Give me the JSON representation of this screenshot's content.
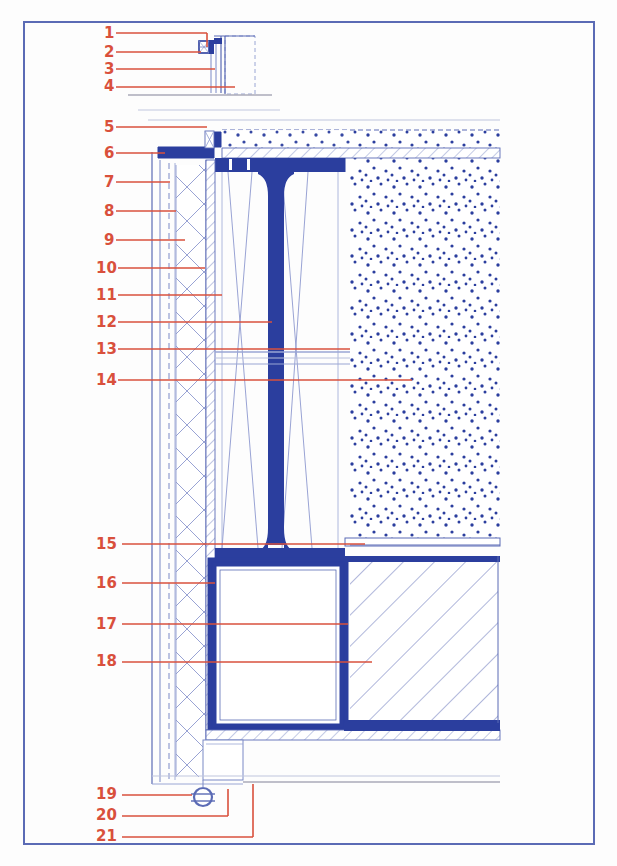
{
  "document": {
    "type": "architectural-detail-section",
    "title": "Curtain wall / facade vertical section detail",
    "border_color": "#5B6BB5",
    "background_color": "#ffffff"
  },
  "palette": {
    "callout_red": "#D9503C",
    "steel_blue_solid": "#2B3E9E",
    "line_blue": "#5B6BB5",
    "line_light_blue": "#9AA6D4",
    "hatch_blue": "#6E7CBE",
    "stipple_blue": "#2B3E9E",
    "thin_grey": "#AAAAB8"
  },
  "callouts": [
    {
      "id": "1",
      "number": "1",
      "label_x": 104,
      "label_y": 38,
      "leader_x1": 116,
      "leader_x2": 207,
      "leader_y": 33,
      "elbow": true,
      "elbow_x": 207,
      "elbow_y2": 47
    },
    {
      "id": "2",
      "number": "2",
      "label_x": 104,
      "label_y": 57,
      "leader_x1": 116,
      "leader_x2": 201,
      "leader_y": 52,
      "elbow": false
    },
    {
      "id": "3",
      "number": "3",
      "label_x": 104,
      "label_y": 74,
      "leader_x1": 116,
      "leader_x2": 215,
      "leader_y": 69,
      "elbow": false
    },
    {
      "id": "4",
      "number": "4",
      "label_x": 104,
      "label_y": 91,
      "leader_x1": 116,
      "leader_x2": 235,
      "leader_y": 87,
      "elbow": false
    },
    {
      "id": "5",
      "number": "5",
      "label_x": 104,
      "label_y": 132,
      "leader_x1": 116,
      "leader_x2": 207,
      "leader_y": 127,
      "elbow": false
    },
    {
      "id": "6",
      "number": "6",
      "label_x": 104,
      "label_y": 158,
      "leader_x1": 116,
      "leader_x2": 165,
      "leader_y": 153,
      "elbow": false
    },
    {
      "id": "7",
      "number": "7",
      "label_x": 104,
      "label_y": 187,
      "leader_x1": 116,
      "leader_x2": 170,
      "leader_y": 182,
      "elbow": false
    },
    {
      "id": "8",
      "number": "8",
      "label_x": 104,
      "label_y": 216,
      "leader_x1": 116,
      "leader_x2": 176,
      "leader_y": 211,
      "elbow": false
    },
    {
      "id": "9",
      "number": "9",
      "label_x": 104,
      "label_y": 245,
      "leader_x1": 116,
      "leader_x2": 185,
      "leader_y": 240,
      "elbow": false
    },
    {
      "id": "10",
      "number": "10",
      "label_x": 96,
      "label_y": 273,
      "leader_x1": 118,
      "leader_x2": 205,
      "leader_y": 268,
      "elbow": false
    },
    {
      "id": "11",
      "number": "11",
      "label_x": 96,
      "label_y": 300,
      "leader_x1": 118,
      "leader_x2": 222,
      "leader_y": 295,
      "elbow": false
    },
    {
      "id": "12",
      "number": "12",
      "label_x": 96,
      "label_y": 327,
      "leader_x1": 118,
      "leader_x2": 272,
      "leader_y": 322,
      "elbow": false
    },
    {
      "id": "13",
      "number": "13",
      "label_x": 96,
      "label_y": 354,
      "leader_x1": 118,
      "leader_x2": 350,
      "leader_y": 349,
      "elbow": false
    },
    {
      "id": "14",
      "number": "14",
      "label_x": 96,
      "label_y": 385,
      "leader_x1": 118,
      "leader_x2": 412,
      "leader_y": 380,
      "elbow": false
    },
    {
      "id": "15",
      "number": "15",
      "label_x": 96,
      "label_y": 549,
      "leader_x1": 122,
      "leader_x2": 365,
      "leader_y": 544,
      "elbow": false
    },
    {
      "id": "16",
      "number": "16",
      "label_x": 96,
      "label_y": 588,
      "leader_x1": 122,
      "leader_x2": 215,
      "leader_y": 583,
      "elbow": false
    },
    {
      "id": "17",
      "number": "17",
      "label_x": 96,
      "label_y": 629,
      "leader_x1": 122,
      "leader_x2": 348,
      "leader_y": 624,
      "elbow": false
    },
    {
      "id": "18",
      "number": "18",
      "label_x": 96,
      "label_y": 666,
      "leader_x1": 122,
      "leader_x2": 372,
      "leader_y": 662,
      "elbow": false
    },
    {
      "id": "19",
      "number": "19",
      "label_x": 96,
      "label_y": 799,
      "leader_x1": 122,
      "leader_x2": 192,
      "leader_y": 795,
      "elbow": false
    },
    {
      "id": "20",
      "number": "20",
      "label_x": 96,
      "label_y": 820,
      "leader_x1": 122,
      "leader_x2": 228,
      "leader_y": 816,
      "elbow": true,
      "elbow_x": 228,
      "elbow_y2": 789
    },
    {
      "id": "21",
      "number": "21",
      "label_x": 96,
      "label_y": 841,
      "leader_x1": 122,
      "leader_x2": 253,
      "leader_y": 837,
      "elbow": true,
      "elbow_x": 253,
      "elbow_y2": 784
    }
  ],
  "materials": {
    "concrete_stipple": {
      "name": "concrete-fill",
      "x": 350,
      "y": 130,
      "w": 150,
      "h": 415
    },
    "diagonal_hatch": {
      "name": "diagonal-hatch-fill",
      "x": 350,
      "y": 558,
      "w": 148,
      "h": 168
    },
    "insulation_zigzag": {
      "name": "insulation-zigzag",
      "x": 175,
      "y": 165,
      "w": 35,
      "h": 615
    },
    "vertical_hatch_strip": {
      "name": "vertical-hatch-strip",
      "x": 205,
      "y": 160,
      "w": 10,
      "h": 570
    }
  },
  "steel_elements": {
    "mullion_i_beam": {
      "name": "i-beam-mullion",
      "top": 157,
      "bottom": 556
    },
    "box_section": {
      "name": "hollow-box-section",
      "x": 212,
      "y": 562,
      "w": 132,
      "h": 166
    },
    "sill_flashing": {
      "name": "sill-flashing",
      "y": 147
    },
    "downpipe_circle": {
      "name": "downpipe-circle",
      "cx": 203,
      "cy": 797,
      "r": 9
    }
  }
}
